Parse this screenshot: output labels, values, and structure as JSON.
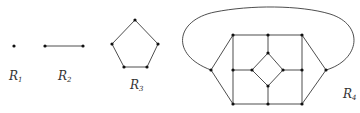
{
  "diagram": {
    "type": "graphs",
    "graphs": [
      {
        "id": "R1",
        "label": "R",
        "subscript": "1",
        "description": "single vertex"
      },
      {
        "id": "R2",
        "label": "R",
        "subscript": "2",
        "description": "two vertices joined by an edge"
      },
      {
        "id": "R3",
        "label": "R",
        "subscript": "3",
        "description": "pentagon (5-cycle)"
      },
      {
        "id": "R4",
        "label": "R",
        "subscript": "4",
        "description": "planar graph: square grid with inner diamond, two side apexes joined by outer loop"
      }
    ]
  },
  "colors": {
    "edge": "#3a3a3a",
    "node": "#111111",
    "label": "#333333"
  }
}
